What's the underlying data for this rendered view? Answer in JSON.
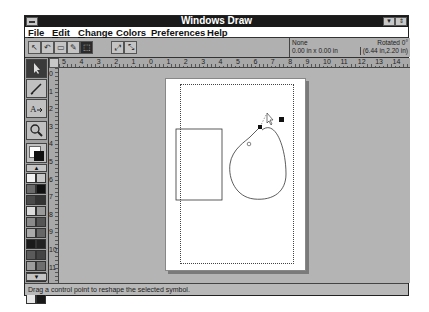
{
  "window": {
    "title": "Windows Draw",
    "controls": {
      "minimize": "▼",
      "maximize": "⇕"
    }
  },
  "menubar": {
    "items": [
      {
        "label": "File",
        "accel": "F"
      },
      {
        "label": "Edit",
        "accel": "E"
      },
      {
        "label": "Change",
        "accel": "C"
      },
      {
        "label": "Colors",
        "accel": "o"
      },
      {
        "label": "Preferences",
        "accel": "P"
      },
      {
        "label": "Help",
        "accel": "H"
      }
    ]
  },
  "toolbar": {
    "buttons": [
      {
        "name": "pointer-mode",
        "glyph": "↖",
        "active": false
      },
      {
        "name": "undo",
        "glyph": "↶",
        "active": false
      },
      {
        "name": "redo",
        "glyph": "▭",
        "active": false
      },
      {
        "name": "node-edit",
        "glyph": "✎",
        "active": false
      },
      {
        "name": "reshape",
        "glyph": "⬚",
        "active": true
      },
      {
        "name": "zoom-in",
        "glyph": "⤢",
        "active": false
      },
      {
        "name": "zoom-out",
        "glyph": "⤡",
        "active": false
      }
    ],
    "info": {
      "fill": "None",
      "size": "0.00 in x 0.00 in",
      "rotation": "Rotated 0°",
      "position": "(6.44 in,2.20 in)"
    }
  },
  "rulers": {
    "horizontal": [
      "5",
      "4",
      "3",
      "2",
      "1",
      "0",
      "1",
      "2",
      "3",
      "4",
      "5",
      "6",
      "7",
      "8",
      "9",
      "10",
      "11",
      "12",
      "13",
      "14"
    ],
    "vertical": [
      "0",
      "1",
      "2",
      "3",
      "4",
      "5",
      "6",
      "7",
      "8",
      "9",
      "10",
      "11"
    ]
  },
  "toolbox": {
    "tools": [
      {
        "name": "select-tool",
        "active": true
      },
      {
        "name": "pencil-tool",
        "active": false
      },
      {
        "name": "text-tool",
        "active": false
      },
      {
        "name": "zoom-tool",
        "active": false
      }
    ],
    "palette_scroll_up": "▲",
    "palette_scroll_down": "▼",
    "palette": [
      "#f2f2f2",
      "#c8c8c8",
      "#6a6a6a",
      "#111111",
      "#4a4a4a",
      "#333333",
      "#dcdcdc",
      "#9a9a9a",
      "#8a8a8a",
      "#555555",
      "#aaaaaa",
      "#666666",
      "#1a1a1a",
      "#222222",
      "#5a5a5a",
      "#444444",
      "#9c9c9c",
      "#6e6e6e",
      "#bcbcbc",
      "#7c7c7c",
      "#8e8e8e",
      "#2c2c2c",
      "#e8e8e8",
      "#181818"
    ]
  },
  "canvas": {
    "shapes": [
      {
        "type": "rectangle",
        "label": "rectangle-shape"
      },
      {
        "type": "curve",
        "label": "reshaped-ellipse"
      }
    ]
  },
  "statusbar": {
    "message": "Drag a control point to reshape the selected symbol."
  }
}
